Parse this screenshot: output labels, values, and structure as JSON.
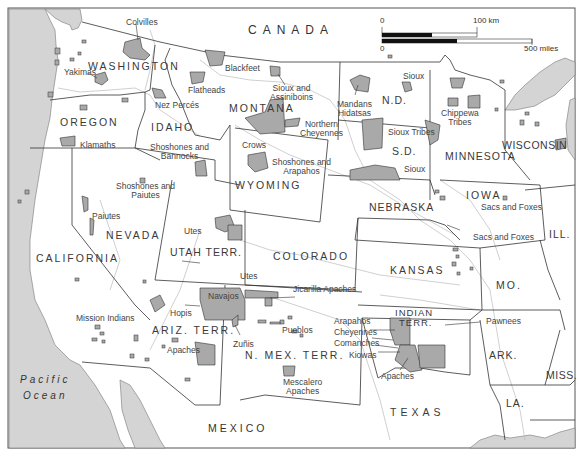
{
  "map": {
    "title": "Western United States Indian Reservations",
    "countries": {
      "canada": "CANADA",
      "mexico": "MEXICO"
    },
    "ocean": {
      "line1": "Pacific",
      "line2": "Ocean"
    },
    "states": {
      "washington": "WASHINGTON",
      "oregon": "OREGON",
      "idaho": "IDAHO",
      "montana": "MONTANA",
      "wyoming": "WYOMING",
      "nevada": "NEVADA",
      "california": "CALIFORNIA",
      "utah": "UTAH TERR.",
      "colorado": "COLORADO",
      "ariz": "ARIZ. TERR.",
      "nmex": "N. MEX. TERR.",
      "nd": "N.D.",
      "sd": "S.D.",
      "nebraska": "NEBRASKA",
      "kansas": "KANSAS",
      "minnesota": "MINNESOTA",
      "wisconsin": "WISCONSIN",
      "iowa": "IOWA",
      "ill": "ILL.",
      "mo": "MO.",
      "indian": "INDIAN",
      "indian2": "TERR.",
      "ark": "ARK.",
      "miss": "MISS.",
      "la": "LA.",
      "texas": "TEXAS"
    },
    "tribes": {
      "colvilles": "Colvilles",
      "yakimas": "Yakimas",
      "blackfeet": "Blackfeet",
      "flatheads": "Flatheads",
      "nezperces": "Nez Percés",
      "sioux_assiniboins_1": "Sioux and",
      "sioux_assiniboins_2": "Assiniboins",
      "klamaths": "Klamaths",
      "shoshones_bannocks_1": "Shoshones and",
      "shoshones_bannocks_2": "Bannocks",
      "crows": "Crows",
      "northern_cheyennes_1": "Northern",
      "northern_cheyennes_2": "Cheyennes",
      "shoshones_arapahos_1": "Shoshones and",
      "shoshones_arapahos_2": "Arapahos",
      "mandans_1": "Mandans",
      "mandans_2": "Hidatsas",
      "sioux_nd": "Sioux",
      "sioux_tribes": "Sioux Tribes",
      "sioux_sd": "Sioux",
      "chippewa_1": "Chippewa",
      "chippewa_2": "Tribes",
      "shoshones_paiutes_1": "Shoshones and",
      "shoshones_paiutes_2": "Paiutes",
      "paiutes": "Paiutes",
      "utes_utah": "Utes",
      "utes_co": "Utes",
      "sacs_foxes_iowa": "Sacs and Foxes",
      "sacs_foxes_ks": "Sacs and Foxes",
      "jicarilla": "Jicarilla Apaches",
      "navajos": "Navajos",
      "hopis": "Hopis",
      "mission": "Mission Indians",
      "pueblos": "Pueblos",
      "zunis": "Zuñis",
      "apaches_az": "Apaches",
      "mescalero_1": "Mescalero",
      "mescalero_2": "Apaches",
      "arapahos": "Arapahos",
      "cheyennes": "Cheyennes",
      "comanches": "Comanches",
      "kiowas": "Kiowas",
      "apaches_ok": "Apaches",
      "pawnees": "Pawnees"
    },
    "scale": {
      "zero_top": "0",
      "km_label": "100 km",
      "zero_bottom": "0",
      "miles_label": "500 miles"
    },
    "colors": {
      "water": "#d4d4d4",
      "reservation": "#a9a9a9",
      "land": "#ffffff",
      "border": "#333333",
      "river": "#b8b8b8"
    }
  }
}
